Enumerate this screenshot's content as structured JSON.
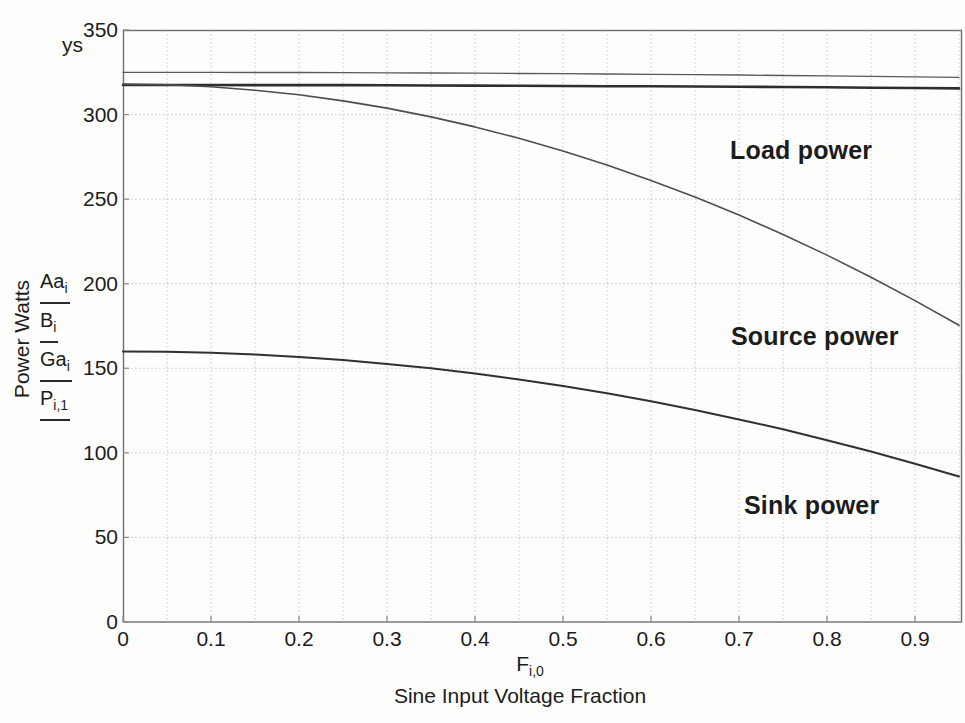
{
  "figure": {
    "y_axis_placeholder": "ys",
    "x_axis_var": {
      "base": "F",
      "sub": "i,0"
    }
  },
  "colors": {
    "background": "#fdfdfc",
    "text": "#1c1c1c",
    "grid": "#c8c8c8",
    "frame": "#6f6f6f",
    "tick": "#8a8a8a",
    "series": [
      "#5a5a5a",
      "#2e2e2e",
      "#4d4d4d",
      "#303030"
    ]
  },
  "chart_data": {
    "type": "line",
    "title": "",
    "xlabel": "Sine Input Voltage Fraction",
    "ylabel": "Power Watts",
    "xlim": [
      0,
      0.954
    ],
    "ylim": [
      0,
      350
    ],
    "x_ticks": [
      0,
      0.1,
      0.2,
      0.3,
      0.4,
      0.5,
      0.6,
      0.7,
      0.8,
      0.9
    ],
    "y_ticks": [
      0,
      50,
      100,
      150,
      200,
      250,
      300,
      350
    ],
    "grid": {
      "x_step": 0.05,
      "y_step": 50,
      "style": "dotted",
      "on": true
    },
    "legend_position": "left-axis-stacked-tags",
    "x": [
      0,
      0.05,
      0.1,
      0.15,
      0.2,
      0.25,
      0.3,
      0.35,
      0.4,
      0.45,
      0.5,
      0.55,
      0.6,
      0.65,
      0.7,
      0.75,
      0.8,
      0.85,
      0.9,
      0.95
    ],
    "series": [
      {
        "name": "Aa[i]",
        "tag_base": "Aa",
        "tag_sub": "i",
        "values": [
          325,
          325,
          325,
          324.9,
          324.9,
          324.8,
          324.7,
          324.6,
          324.5,
          324.3,
          324.2,
          324,
          323.8,
          323.6,
          323.4,
          323.1,
          322.9,
          322.6,
          322.3,
          322
        ]
      },
      {
        "name": "B[i]",
        "tag_base": "B",
        "tag_sub": "i",
        "values": [
          317.5,
          317.5,
          317.5,
          317.4,
          317.4,
          317.4,
          317.3,
          317.2,
          317.1,
          317,
          316.9,
          316.8,
          316.7,
          316.6,
          316.4,
          316.3,
          316.1,
          315.9,
          315.7,
          315.5
        ]
      },
      {
        "name": "Ga[i]",
        "tag_base": "Ga",
        "tag_sub": "i",
        "values": [
          318,
          317.6,
          316.4,
          314.4,
          311.7,
          308.1,
          303.8,
          298.6,
          292.7,
          286,
          278.5,
          270.2,
          261.1,
          251.2,
          240.6,
          229.1,
          216.9,
          203.8,
          190,
          175.4
        ]
      },
      {
        "name": "P[i,1]",
        "tag_base": "P",
        "tag_sub": "i,1",
        "values": [
          160,
          159.8,
          159.2,
          158.2,
          156.7,
          154.9,
          152.6,
          150,
          146.9,
          143.4,
          139.5,
          135.2,
          130.5,
          125.4,
          119.8,
          113.9,
          107.5,
          100.8,
          93.6,
          86
        ]
      }
    ],
    "annotations": [
      {
        "text": "Load power",
        "x": 0.77,
        "y": 279
      },
      {
        "text": "Source power",
        "x": 0.78,
        "y": 169
      },
      {
        "text": "Sink power",
        "x": 0.78,
        "y": 69
      }
    ]
  }
}
